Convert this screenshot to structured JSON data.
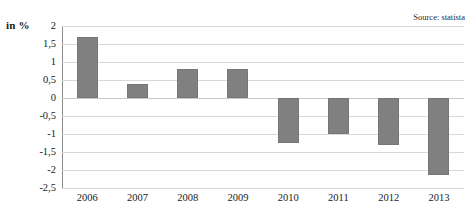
{
  "axis_unit_label": "in %",
  "source_label": "Source: statista",
  "chart_data": {
    "type": "bar",
    "title": "",
    "subtitle": "",
    "xlabel": "",
    "ylabel": "in %",
    "categories": [
      "2006",
      "2007",
      "2008",
      "2009",
      "2010",
      "2011",
      "2012",
      "2013"
    ],
    "values": [
      1.7,
      0.4,
      0.8,
      0.8,
      -1.25,
      -1.0,
      -1.3,
      -2.15
    ],
    "series": [
      {
        "name": "in %",
        "values": [
          1.7,
          0.4,
          0.8,
          0.8,
          -1.25,
          -1.0,
          -1.3,
          -2.15
        ]
      }
    ],
    "ylim": [
      -2.5,
      2
    ],
    "ytick_values": [
      2,
      1.5,
      1,
      0.5,
      0,
      -0.5,
      -1,
      -1.5,
      -2,
      -2.5
    ],
    "ytick_labels": [
      "2",
      "1,5",
      "1",
      "0,5",
      "0",
      "-0,5",
      "-1",
      "-1,5",
      "-2",
      "-2,5"
    ],
    "grid": true,
    "legend": false,
    "legend_position": "none",
    "bar_color": "#808080",
    "gridline_color": "#d9d9d9",
    "background_color": "#ffffff",
    "annotations": [
      "Source: statista"
    ]
  }
}
